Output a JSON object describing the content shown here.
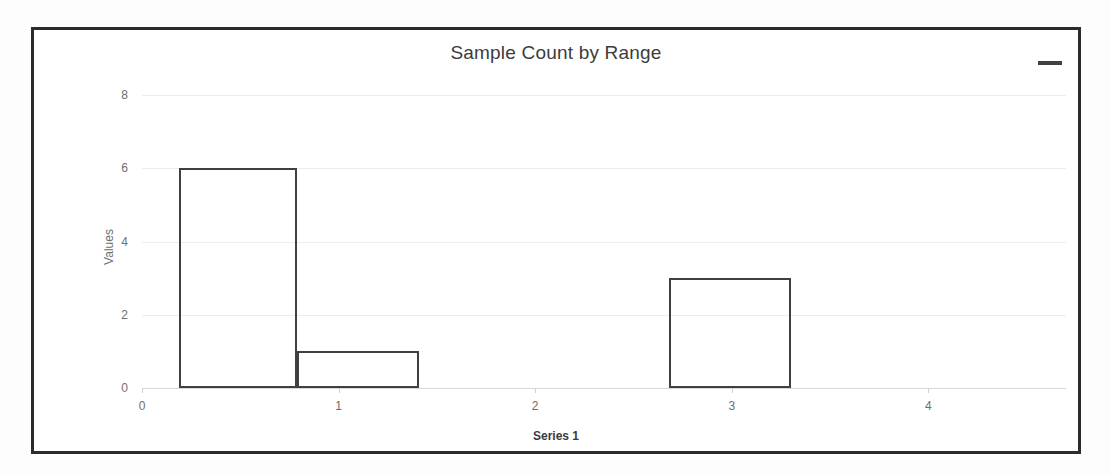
{
  "chart": {
    "title": "Sample Count by Range",
    "menu_icon": "hamburger-menu-icon",
    "x_axis_title": "Series 1",
    "y_axis_title": "Values"
  },
  "colors": {
    "frame_border": "#2b2b2b",
    "bar_stroke": "#404040",
    "gridline": "#ededed",
    "axis_text": "#6e6e6e",
    "title_text": "#3c3c3c",
    "background": "#ffffff"
  },
  "chart_data": {
    "type": "bar",
    "title": "Sample Count by Range",
    "xlabel": "Series 1",
    "ylabel": "Values",
    "xlim": [
      0,
      4.7
    ],
    "ylim": [
      0,
      8
    ],
    "grid": true,
    "legend": false,
    "x_ticks": [
      "0",
      "1",
      "2",
      "3",
      "4"
    ],
    "x_tick_values": [
      0,
      1,
      2,
      3,
      4
    ],
    "y_ticks": [
      "0",
      "2",
      "4",
      "6",
      "8"
    ],
    "y_tick_values": [
      0,
      2,
      4,
      6,
      8
    ],
    "categories": [
      "0",
      "1",
      "2",
      "3",
      "4"
    ],
    "values": [
      6,
      1,
      0,
      3,
      0
    ],
    "bars": [
      {
        "label": "0",
        "center": 0.49,
        "left": 0.19,
        "right": 0.79,
        "value": 6
      },
      {
        "label": "1",
        "center": 1.1,
        "left": 0.79,
        "right": 1.41,
        "value": 1
      },
      {
        "label": "3",
        "center": 2.99,
        "left": 2.68,
        "right": 3.3,
        "value": 3
      }
    ],
    "series": [
      {
        "name": "Series 1",
        "values": [
          6,
          1,
          0,
          3,
          0
        ]
      }
    ]
  }
}
